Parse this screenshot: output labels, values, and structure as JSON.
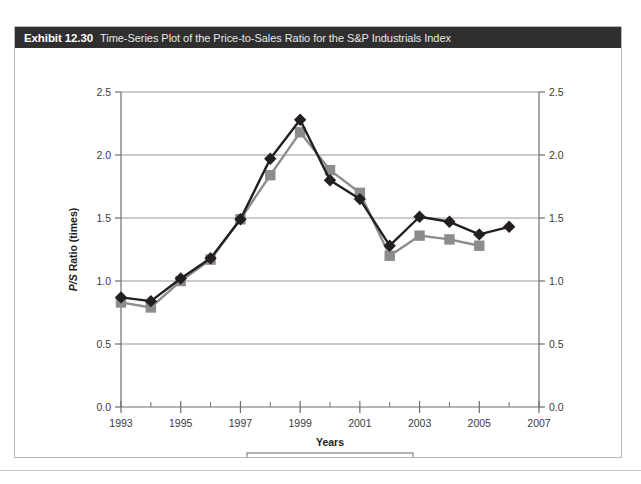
{
  "exhibit": {
    "number": "Exhibit 12.30",
    "caption": "Time-Series Plot of the Price-to-Sales Ratio for the S&P Industrials Index"
  },
  "chart_data": {
    "type": "line",
    "title": "Time-Series Plot of the Price-to-Sales Ratio for the S&P Industrials Index",
    "xlabel": "Years",
    "ylabel": "P/S Ratio (times)",
    "ylabel_italic_part": "P/S",
    "ylabel_rest": " Ratio (times)",
    "xlim": [
      1993,
      2007
    ],
    "ylim": [
      0.0,
      2.5
    ],
    "grid": true,
    "grid_axis": "y",
    "legend_position": "bottom-center",
    "x": [
      1993,
      1994,
      1995,
      1996,
      1997,
      1998,
      1999,
      2000,
      2001,
      2002,
      2003,
      2004,
      2005,
      2006
    ],
    "xticks": [
      1993,
      1995,
      1997,
      1999,
      2001,
      2003,
      2005,
      2007
    ],
    "xticklabels": [
      "1993",
      "1995",
      "1997",
      "1999",
      "2001",
      "2003",
      "2005",
      "2007"
    ],
    "xminorticks": [
      1994,
      1996,
      1998,
      2000,
      2002,
      2004,
      2006
    ],
    "yticks": [
      0.0,
      0.5,
      1.0,
      1.5,
      2.0,
      2.5
    ],
    "yticklabels": [
      "0.0",
      "0.5",
      "1.0",
      "1.5",
      "2.0",
      "2.5"
    ],
    "right_axis": true,
    "right_yticklabels": [
      "0.0",
      "0.5",
      "1.0",
      "1.5",
      "2.0",
      "2.5"
    ],
    "series": [
      {
        "name": "t",
        "color": "#231f20",
        "marker": "diamond",
        "values": [
          0.87,
          0.84,
          1.02,
          1.18,
          1.49,
          1.97,
          2.28,
          1.8,
          1.65,
          1.28,
          1.51,
          1.47,
          1.37,
          1.43
        ]
      },
      {
        "name": "t+1",
        "color": "#8c8c8c",
        "marker": "square",
        "values": [
          0.83,
          0.79,
          1.0,
          1.17,
          1.49,
          1.84,
          2.18,
          1.88,
          1.7,
          1.2,
          1.36,
          1.33,
          1.28,
          null
        ]
      }
    ]
  },
  "legend": {
    "items": [
      {
        "label": "t",
        "marker": "diamond",
        "color": "#231f20"
      },
      {
        "label": "t+1",
        "marker": "square",
        "color": "#8c8c8c"
      }
    ]
  }
}
